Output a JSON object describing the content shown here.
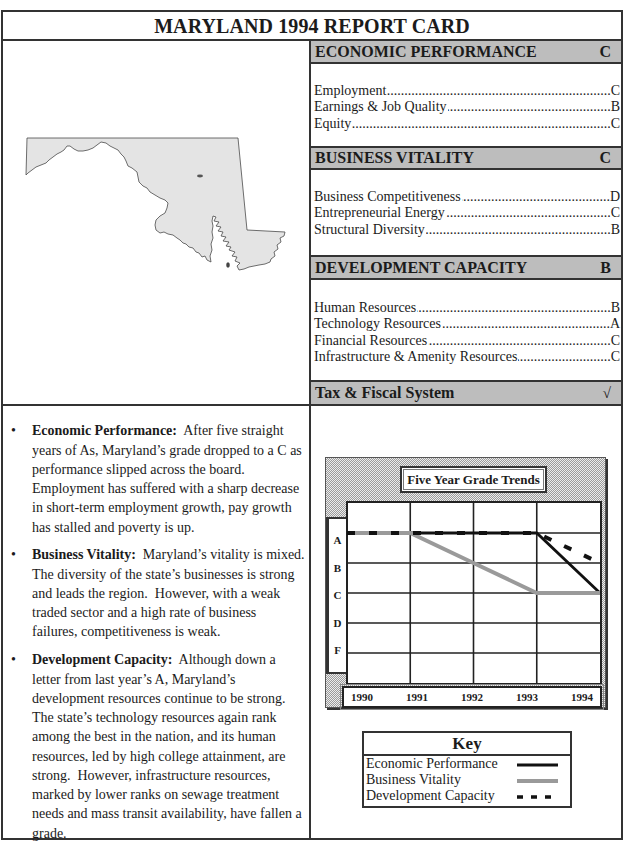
{
  "title": "MARYLAND 1994 REPORT CARD",
  "map": {
    "icon": "maryland-state-outline"
  },
  "grades_panel": {
    "sections": [
      {
        "name": "ECONOMIC PERFORMANCE",
        "grade": "C",
        "items": [
          {
            "label": "Employment",
            "grade": "C"
          },
          {
            "label": "Earnings & Job Quality",
            "grade": "B"
          },
          {
            "label": "Equity",
            "grade": "C"
          }
        ]
      },
      {
        "name": "BUSINESS VITALITY",
        "grade": "C",
        "items": [
          {
            "label": "Business Competitiveness",
            "grade": "D"
          },
          {
            "label": "Entrepreneurial Energy",
            "grade": "C"
          },
          {
            "label": "Structural Diversity",
            "grade": "B"
          }
        ]
      },
      {
        "name": "DEVELOPMENT CAPACITY",
        "grade": "B",
        "items": [
          {
            "label": "Human Resources",
            "grade": "B"
          },
          {
            "label": "Technology Resources",
            "grade": "A"
          },
          {
            "label": "Financial Resources",
            "grade": "C"
          },
          {
            "label": "Infrastructure & Amenity Resources",
            "grade": "C"
          }
        ]
      },
      {
        "name": "Tax & Fiscal System",
        "grade": "√"
      }
    ]
  },
  "summary": [
    {
      "heading": "Economic Performance:",
      "text": "  After five straight years of As, Maryland’s grade dropped to a C as performance slipped across the board.  Employment has suffered with a sharp decrease in short-term employment growth, pay growth has stalled and poverty is up."
    },
    {
      "heading": "Business Vitality:",
      "text": "  Maryland’s vitality is mixed.  The diversity of the state’s businesses is strong and leads the region.  However, with a weak traded sector and a high rate of business failures, competitiveness is weak."
    },
    {
      "heading": "Development Capacity:",
      "text": "  Although down a letter from last year’s A, Maryland’s development resources continue to be strong. The state’s technology resources again rank among the best in the nation, and its human resources, led by high college attainment, are strong.  However, infrastructure resources, marked by lower ranks on sewage treatment needs and mass transit availability, have fallen a grade."
    }
  ],
  "chart_data": {
    "type": "line",
    "title": "Five Year Grade Trends",
    "xlabel": "",
    "ylabel": "",
    "categories": [
      "1990",
      "1991",
      "1992",
      "1993",
      "1994"
    ],
    "y_levels": [
      "A",
      "B",
      "C",
      "D",
      "F"
    ],
    "grid": true,
    "legend_position": "below",
    "series": [
      {
        "name": "Economic Performance",
        "values": [
          "A",
          "A",
          "A",
          "A",
          "C"
        ],
        "color": "#111111",
        "style": "solid"
      },
      {
        "name": "Business Vitality",
        "values": [
          "A",
          "A",
          "B",
          "C",
          "C"
        ],
        "color": "#9a9a9a",
        "style": "solid"
      },
      {
        "name": "Development Capacity",
        "values": [
          "A",
          "A",
          "A",
          "A",
          "B"
        ],
        "color": "#111111",
        "style": "dashed"
      }
    ]
  },
  "key": {
    "title": "Key"
  },
  "colors": {
    "header_bar": "#bdbdbd",
    "border": "#333333",
    "map_fill": "#e4e4e4"
  }
}
